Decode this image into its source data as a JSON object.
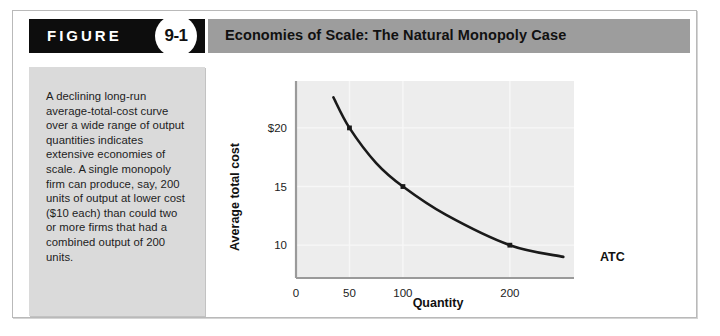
{
  "figure": {
    "label": "FIGURE",
    "number": "9-1",
    "title": "Economies of Scale: The Natural Monopoly Case",
    "caption": "A declining long-run average-total-cost curve over a wide range of output quantities indicates extensive economies of scale. A single monopoly firm can produce, say, 200 units of output at lower cost ($10 each) than could two or more firms that had a combined output of 200 units."
  },
  "colors": {
    "badge_bar": "#0d0d0d",
    "title_bar": "#9d9d9d",
    "caption_panel": "#dadada",
    "plot_background": "#ededed",
    "curve": "#1a1a1a",
    "gridline": "#f7f7f7",
    "axis_spine": "#9a9a9a"
  },
  "chart_data": {
    "type": "line",
    "title": "",
    "xlabel": "Quantity",
    "ylabel": "Average total cost",
    "xlim": [
      0,
      260
    ],
    "ylim": [
      7.2,
      24
    ],
    "grid": true,
    "legend_position": "curve-end-right",
    "xticks": [
      {
        "value": 0,
        "label": "0"
      },
      {
        "value": 50,
        "label": "50"
      },
      {
        "value": 100,
        "label": "100"
      },
      {
        "value": 200,
        "label": "200"
      }
    ],
    "yticks": [
      {
        "value": 20,
        "label": "$20"
      },
      {
        "value": 15,
        "label": "15"
      },
      {
        "value": 10,
        "label": "10"
      }
    ],
    "series": [
      {
        "name": "ATC",
        "label": "ATC",
        "x": [
          35,
          50,
          75,
          100,
          140,
          200,
          250
        ],
        "values": [
          22.6,
          20,
          17.0,
          15,
          12.6,
          10,
          9.0
        ],
        "markers": [
          {
            "x": 50,
            "y": 20
          },
          {
            "x": 100,
            "y": 15
          },
          {
            "x": 200,
            "y": 10
          }
        ]
      }
    ]
  }
}
